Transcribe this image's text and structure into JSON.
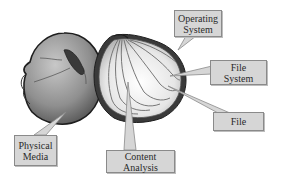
{
  "diagram": {
    "labels": {
      "operating_system": [
        "Operating",
        "System"
      ],
      "file_system": [
        "File",
        "System"
      ],
      "file": [
        "File"
      ],
      "physical_media": [
        "Physical",
        "Media"
      ],
      "content_analysis": [
        "Content",
        "Analysis"
      ]
    },
    "colors": {
      "callout_fill": "#d6d6d6",
      "callout_border": "#8a8a8a",
      "text": "#2a2a2a",
      "outline": "#1e1e1e"
    }
  }
}
